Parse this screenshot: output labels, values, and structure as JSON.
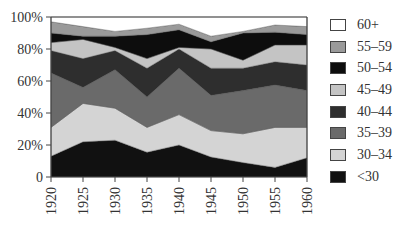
{
  "chart_data": {
    "type": "area",
    "stacked": true,
    "title": "",
    "xlabel": "",
    "ylabel": "",
    "x": [
      1920,
      1925,
      1930,
      1935,
      1940,
      1945,
      1950,
      1955,
      1960
    ],
    "ylim": [
      0,
      100
    ],
    "yticks": [
      "0",
      "20%",
      "40%",
      "60%",
      "80%",
      "100%"
    ],
    "xticks": [
      "1920",
      "1925",
      "1930",
      "1935",
      "1940",
      "1945",
      "1950",
      "1955",
      "1960"
    ],
    "legend_position": "right",
    "grid": false,
    "series": [
      {
        "name": "<30",
        "color": "#111111",
        "values": [
          13,
          22,
          23,
          15.5,
          20,
          12.5,
          9,
          6,
          12
        ]
      },
      {
        "name": "30–34",
        "color": "#d4d4d4",
        "values": [
          18,
          24,
          20,
          15.5,
          19,
          16.5,
          18,
          25,
          19
        ]
      },
      {
        "name": "35–39",
        "color": "#6a6a6a",
        "values": [
          34,
          10,
          24,
          19,
          29,
          22,
          27,
          26.5,
          23
        ]
      },
      {
        "name": "40–44",
        "color": "#2e2e2e",
        "values": [
          14,
          18,
          12,
          18,
          12,
          17,
          14,
          14.5,
          16
        ]
      },
      {
        "name": "45–49",
        "color": "#c4c4c4",
        "values": [
          5,
          12,
          2,
          6,
          1,
          12,
          5,
          10.5,
          12.5
        ]
      },
      {
        "name": "50–54",
        "color": "#0d0d0d",
        "values": [
          6,
          2,
          7,
          15,
          11,
          4.5,
          17,
          8,
          6.5
        ]
      },
      {
        "name": "55–59",
        "color": "#9a9a9a",
        "values": [
          7,
          6,
          3,
          4,
          3.5,
          3.5,
          1,
          4.5,
          5
        ]
      },
      {
        "name": "60+",
        "color": "#ffffff",
        "values": [
          3,
          6,
          9,
          7,
          4.5,
          12,
          9,
          5,
          6
        ]
      }
    ]
  },
  "legend": {
    "items": [
      {
        "label": "60+",
        "color": "#ffffff"
      },
      {
        "label": "55–59",
        "color": "#9a9a9a"
      },
      {
        "label": "50–54",
        "color": "#0d0d0d"
      },
      {
        "label": "45–49",
        "color": "#c4c4c4"
      },
      {
        "label": "40–44",
        "color": "#2e2e2e"
      },
      {
        "label": "35–39",
        "color": "#6a6a6a"
      },
      {
        "label": "30–34",
        "color": "#d4d4d4"
      },
      {
        "label": "<30",
        "color": "#111111"
      }
    ]
  }
}
